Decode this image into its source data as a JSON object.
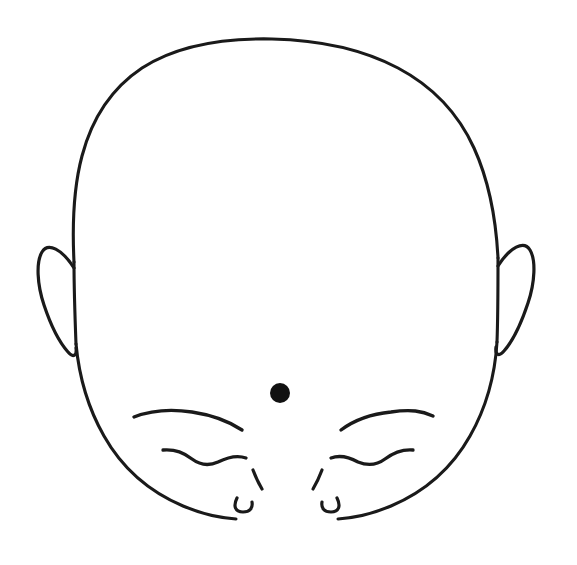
{
  "figure": {
    "kind": "line-drawing",
    "title": "",
    "caption": "",
    "background_color": "#ffffff",
    "stroke_color": "#1a1a1a",
    "canvas": {
      "width": 577,
      "height": 565
    }
  },
  "marker": {
    "label": "",
    "shape": "filled-circle",
    "color": "#111111",
    "center_x": 280,
    "center_y": 393,
    "radius": 10
  },
  "parts": {
    "head_outline": "head-outline",
    "left_ear": "left-ear",
    "right_ear": "right-ear",
    "left_eyebrow": "left-eyebrow",
    "right_eyebrow": "right-eyebrow",
    "left_eye": "left-closed-eye",
    "right_eye": "right-closed-eye",
    "nose_left_nostril": "nose-left-tick",
    "nose_right_nostril": "nose-right-tick",
    "left_cheek": "left-cheek-curve",
    "right_cheek": "right-cheek-curve"
  },
  "annotations": []
}
